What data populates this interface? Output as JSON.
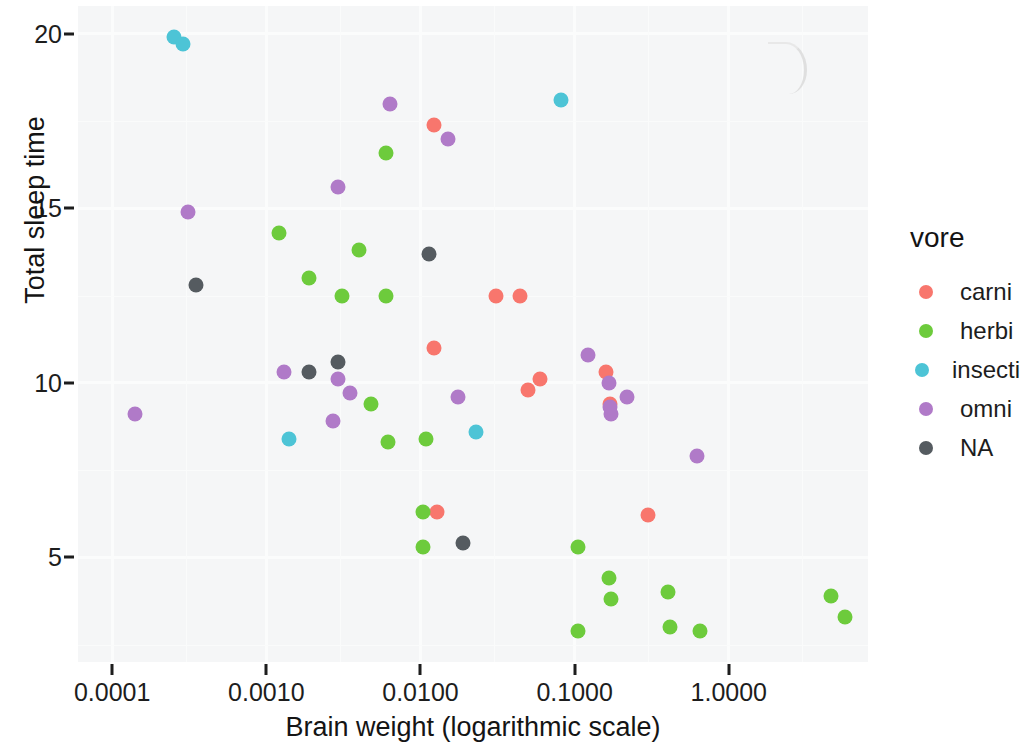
{
  "chart_data": {
    "type": "scatter",
    "title": "",
    "xlabel": "Brain weight (logarithmic scale)",
    "ylabel": "Total sleep time",
    "x_scale": "log10",
    "xlim": [
      6e-05,
      8.0
    ],
    "ylim": [
      2.0,
      20.8
    ],
    "x_ticks": [
      "0.0001",
      "0.0010",
      "0.0100",
      "0.1000",
      "1.0000"
    ],
    "x_tick_values": [
      0.0001,
      0.001,
      0.01,
      0.1,
      1.0
    ],
    "y_ticks": [
      "20",
      "15",
      "10",
      "5"
    ],
    "y_tick_values": [
      20,
      15,
      10,
      5
    ],
    "grid": true,
    "legend_position": "right",
    "legend_title": "vore",
    "series": [
      {
        "name": "carni",
        "color": "#F8766D",
        "points": [
          {
            "x": 0.0122,
            "y": 17.4
          },
          {
            "x": 0.0307,
            "y": 12.5
          },
          {
            "x": 0.0445,
            "y": 12.5
          },
          {
            "x": 0.0123,
            "y": 11.0
          },
          {
            "x": 0.06,
            "y": 10.1
          },
          {
            "x": 0.159,
            "y": 10.3
          },
          {
            "x": 0.05,
            "y": 9.8
          },
          {
            "x": 0.17,
            "y": 9.4
          },
          {
            "x": 0.3,
            "y": 6.2
          },
          {
            "x": 0.0128,
            "y": 6.3
          }
        ]
      },
      {
        "name": "herbi",
        "color": "#6DCB3C",
        "points": [
          {
            "x": 0.006,
            "y": 16.6
          },
          {
            "x": 0.0012,
            "y": 14.3
          },
          {
            "x": 0.004,
            "y": 13.8
          },
          {
            "x": 0.0019,
            "y": 13.0
          },
          {
            "x": 0.0031,
            "y": 12.5
          },
          {
            "x": 0.006,
            "y": 12.5
          },
          {
            "x": 0.0048,
            "y": 9.4
          },
          {
            "x": 0.0109,
            "y": 8.4
          },
          {
            "x": 0.0062,
            "y": 8.3
          },
          {
            "x": 0.0104,
            "y": 6.3
          },
          {
            "x": 0.0104,
            "y": 5.3
          },
          {
            "x": 0.105,
            "y": 5.3
          },
          {
            "x": 0.168,
            "y": 4.4
          },
          {
            "x": 0.172,
            "y": 3.8
          },
          {
            "x": 0.405,
            "y": 4.0
          },
          {
            "x": 0.105,
            "y": 2.9
          },
          {
            "x": 0.415,
            "y": 3.0
          },
          {
            "x": 0.655,
            "y": 2.9
          },
          {
            "x": 4.6,
            "y": 3.9
          },
          {
            "x": 5.7,
            "y": 3.3
          }
        ]
      },
      {
        "name": "insecti",
        "color": "#4DC4D6",
        "points": [
          {
            "x": 0.00025,
            "y": 19.9
          },
          {
            "x": 0.00029,
            "y": 19.7
          },
          {
            "x": 0.081,
            "y": 18.1
          },
          {
            "x": 0.0014,
            "y": 8.4
          },
          {
            "x": 0.023,
            "y": 8.6
          }
        ]
      },
      {
        "name": "omni",
        "color": "#B07AC8",
        "points": [
          {
            "x": 0.0063,
            "y": 18.0
          },
          {
            "x": 0.0151,
            "y": 17.0
          },
          {
            "x": 0.0029,
            "y": 15.6
          },
          {
            "x": 0.00031,
            "y": 14.9
          },
          {
            "x": 0.0013,
            "y": 10.3
          },
          {
            "x": 0.0029,
            "y": 10.1
          },
          {
            "x": 0.0035,
            "y": 9.7
          },
          {
            "x": 0.0027,
            "y": 8.9
          },
          {
            "x": 0.00014,
            "y": 9.1
          },
          {
            "x": 0.0175,
            "y": 9.6
          },
          {
            "x": 0.122,
            "y": 10.8
          },
          {
            "x": 0.168,
            "y": 10.0
          },
          {
            "x": 0.172,
            "y": 9.1
          },
          {
            "x": 0.17,
            "y": 9.3
          },
          {
            "x": 0.22,
            "y": 9.6
          },
          {
            "x": 0.62,
            "y": 7.9
          }
        ]
      },
      {
        "name": "NA",
        "color": "#555B60",
        "points": [
          {
            "x": 0.00035,
            "y": 12.8
          },
          {
            "x": 0.0114,
            "y": 13.7
          },
          {
            "x": 0.0029,
            "y": 10.6
          },
          {
            "x": 0.0019,
            "y": 10.3
          },
          {
            "x": 0.019,
            "y": 5.4
          }
        ]
      }
    ]
  },
  "axes": {
    "y_title": "Total sleep time",
    "x_title": "Brain weight (logarithmic scale)"
  },
  "legend": {
    "title": "vore",
    "items": [
      {
        "label": "carni",
        "color": "#F8766D"
      },
      {
        "label": "herbi",
        "color": "#6DCB3C"
      },
      {
        "label": "insecti",
        "color": "#4DC4D6"
      },
      {
        "label": "omni",
        "color": "#B07AC8"
      },
      {
        "label": "NA",
        "color": "#555B60"
      }
    ]
  }
}
